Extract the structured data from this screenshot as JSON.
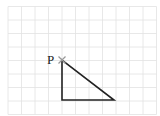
{
  "diagram": {
    "type": "grid-with-triangle",
    "grid": {
      "x_lines": [
        8,
        21.5,
        35,
        48.5,
        62,
        75.5,
        89,
        102.5,
        116,
        129.5,
        143,
        156.5
      ],
      "y_lines": [
        6.5,
        20,
        33.5,
        47,
        60.5,
        74,
        87.5,
        101,
        114.5
      ],
      "color": "#e2e2e2"
    },
    "triangle": {
      "points": [
        [
          62,
          60
        ],
        [
          62,
          100
        ],
        [
          114,
          100
        ]
      ],
      "stroke": "#222222"
    },
    "point": {
      "label": "P",
      "x": 62,
      "y": 60,
      "marker": "cross",
      "marker_color": "#999999"
    }
  }
}
